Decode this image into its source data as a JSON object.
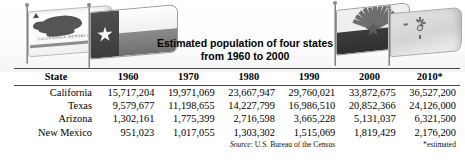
{
  "title": {
    "line1": "Estimated population of four states",
    "line2": "from 1960 to 2000"
  },
  "flags": [
    {
      "name": "california-flag",
      "state": "California",
      "motto": "CALIFORNIA REPUBLIC"
    },
    {
      "name": "texas-flag",
      "state": "Texas"
    },
    {
      "name": "arizona-flag",
      "state": "Arizona"
    },
    {
      "name": "new-mexico-flag",
      "state": "New Mexico"
    }
  ],
  "table": {
    "headers": [
      "State",
      "1960",
      "1970",
      "1980",
      "1990",
      "2000",
      "2010*"
    ],
    "rows": [
      {
        "state": "California",
        "v1960": "15,717,204",
        "v1970": "19,971,069",
        "v1980": "23,667,947",
        "v1990": "29,760,021",
        "v2000": "33,872,675",
        "v2010": "36,527,200"
      },
      {
        "state": "Texas",
        "v1960": "9,579,677",
        "v1970": "11,198,655",
        "v1980": "14,227,799",
        "v1990": "16,986,510",
        "v2000": "20,852,366",
        "v2010": "24,126,000"
      },
      {
        "state": "Arizona",
        "v1960": "1,302,161",
        "v1970": "1,775,399",
        "v1980": "2,716,598",
        "v1990": "3,665,228",
        "v2000": "5,131,037",
        "v2010": "6,321,500"
      },
      {
        "state": "New Mexico",
        "v1960": "951,023",
        "v1970": "1,017,055",
        "v1980": "1,303,302",
        "v1990": "1,515,069",
        "v2000": "1,819,429",
        "v2010": "2,176,200"
      }
    ]
  },
  "footer": {
    "source_label": "Source",
    "source_text": ": U.S. Bureau of the Census",
    "estimated_note": "*estimated"
  },
  "chart_data": {
    "type": "table",
    "title": "Estimated population of four states from 1960 to 2000",
    "categories": [
      "1960",
      "1970",
      "1980",
      "1990",
      "2000",
      "2010*"
    ],
    "xlabel": "Year",
    "ylabel": "Population",
    "series": [
      {
        "name": "California",
        "values": [
          15717204,
          19971069,
          23667947,
          29760021,
          33872675,
          36527200
        ]
      },
      {
        "name": "Texas",
        "values": [
          9579677,
          11198655,
          14227799,
          16986510,
          20852366,
          24126000
        ]
      },
      {
        "name": "Arizona",
        "values": [
          1302161,
          1775399,
          2716598,
          3665228,
          5131037,
          6321500
        ]
      },
      {
        "name": "New Mexico",
        "values": [
          951023,
          1017055,
          1303302,
          1515069,
          1819429,
          2176200
        ]
      }
    ],
    "annotations": [
      "Source: U.S. Bureau of the Census",
      "*estimated"
    ]
  }
}
